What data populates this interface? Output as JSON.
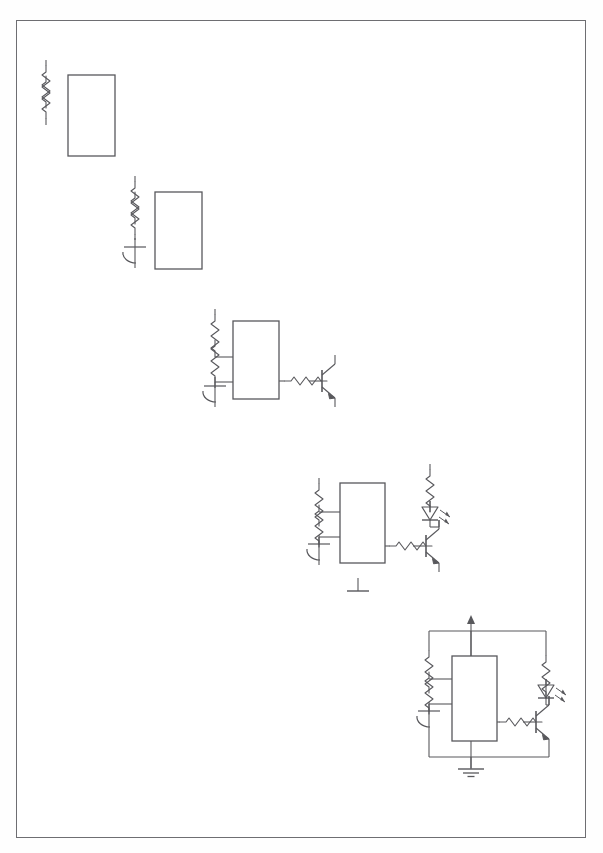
{
  "document": {
    "type": "scanned-schematic-page",
    "title": "Progressive circuit construction worksheet",
    "page_background": "#ffffff",
    "border_color": "#6e6e72",
    "ink_color": "#58585c",
    "stage_count": 5
  },
  "stages": [
    {
      "id": "stage-1",
      "label": "Stage 1 - resistor divider and IC outline",
      "components": [
        {
          "name": "resistor-r1",
          "type": "resistor",
          "orientation": "vertical"
        },
        {
          "name": "resistor-r2",
          "type": "resistor",
          "orientation": "vertical"
        },
        {
          "name": "ic-block",
          "type": "ic-rectangle",
          "orientation": "vertical"
        }
      ]
    },
    {
      "id": "stage-2",
      "label": "Stage 2 - adds timing capacitor",
      "components": [
        {
          "name": "resistor-r1",
          "type": "resistor",
          "orientation": "vertical"
        },
        {
          "name": "resistor-r2",
          "type": "resistor",
          "orientation": "vertical"
        },
        {
          "name": "capacitor-c1",
          "type": "polarized-capacitor",
          "orientation": "vertical"
        },
        {
          "name": "ic-block",
          "type": "ic-rectangle",
          "orientation": "vertical"
        }
      ]
    },
    {
      "id": "stage-3",
      "label": "Stage 3 - adds IC pin wiring, base resistor and NPN transistor",
      "components": [
        {
          "name": "resistor-r1",
          "type": "resistor",
          "orientation": "vertical"
        },
        {
          "name": "resistor-r2",
          "type": "resistor",
          "orientation": "vertical"
        },
        {
          "name": "capacitor-c1",
          "type": "polarized-capacitor",
          "orientation": "vertical"
        },
        {
          "name": "ic-block",
          "type": "ic-rectangle",
          "orientation": "vertical"
        },
        {
          "name": "resistor-rb",
          "type": "resistor",
          "orientation": "horizontal"
        },
        {
          "name": "transistor-q1",
          "type": "npn-transistor",
          "orientation": "horizontal"
        }
      ]
    },
    {
      "id": "stage-4",
      "label": "Stage 4 - adds LED indicator branch and ground symbol",
      "components": [
        {
          "name": "resistor-r1",
          "type": "resistor",
          "orientation": "vertical"
        },
        {
          "name": "resistor-r2",
          "type": "resistor",
          "orientation": "vertical"
        },
        {
          "name": "capacitor-c1",
          "type": "polarized-capacitor",
          "orientation": "vertical"
        },
        {
          "name": "ic-block",
          "type": "ic-rectangle",
          "orientation": "vertical"
        },
        {
          "name": "resistor-rb",
          "type": "resistor",
          "orientation": "horizontal"
        },
        {
          "name": "transistor-q1",
          "type": "npn-transistor",
          "orientation": "horizontal"
        },
        {
          "name": "resistor-rl",
          "type": "resistor",
          "orientation": "vertical"
        },
        {
          "name": "led-d1",
          "type": "led",
          "orientation": "vertical"
        },
        {
          "name": "ground-single",
          "type": "ground-bar",
          "orientation": "vertical"
        }
      ]
    },
    {
      "id": "stage-5",
      "label": "Stage 5 - complete circuit with supply rail and ground bus",
      "components": [
        {
          "name": "supply-arrow",
          "type": "supply-rail-arrow",
          "orientation": "vertical"
        },
        {
          "name": "resistor-r1",
          "type": "resistor",
          "orientation": "vertical"
        },
        {
          "name": "resistor-r2",
          "type": "resistor",
          "orientation": "vertical"
        },
        {
          "name": "capacitor-c1",
          "type": "polarized-capacitor",
          "orientation": "vertical"
        },
        {
          "name": "ic-block",
          "type": "ic-rectangle",
          "orientation": "vertical"
        },
        {
          "name": "resistor-rb",
          "type": "resistor",
          "orientation": "horizontal"
        },
        {
          "name": "transistor-q1",
          "type": "npn-transistor",
          "orientation": "horizontal"
        },
        {
          "name": "resistor-rl",
          "type": "resistor",
          "orientation": "vertical"
        },
        {
          "name": "led-d1",
          "type": "led",
          "orientation": "vertical"
        },
        {
          "name": "ground-multi",
          "type": "ground-multibar",
          "orientation": "vertical"
        },
        {
          "name": "supply-bus",
          "type": "wire-bus",
          "orientation": "horizontal"
        },
        {
          "name": "ground-bus",
          "type": "wire-bus",
          "orientation": "horizontal"
        }
      ]
    }
  ]
}
